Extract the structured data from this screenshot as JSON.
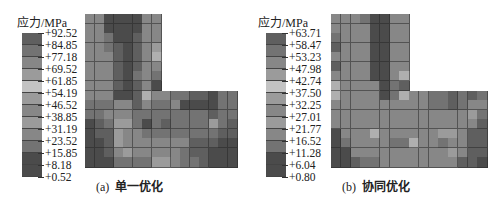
{
  "chart_data": [
    {
      "type": "heatmap",
      "title": "(a) 单一优化",
      "panel_label": "(a)",
      "panel_name": "单一优化",
      "legend_title": "应力/MPa",
      "colorbar_ticks": [
        "+92.52",
        "+84.85",
        "+77.18",
        "+69.52",
        "+61.85",
        "+54.19",
        "+46.52",
        "+38.85",
        "+31.19",
        "+23.52",
        "+15.85",
        "+8.18",
        "+0.52"
      ],
      "vmin": 0.52,
      "vmax": 92.52,
      "grid": {
        "rows": 16,
        "cols": 16,
        "shape": "L-shaped (upper-right 8x8 empty)"
      },
      "shade_levels_1dark_9light": [
        [
          5,
          5,
          2,
          2,
          2,
          2,
          5,
          5,
          0,
          0,
          0,
          0,
          0,
          0,
          0,
          0
        ],
        [
          5,
          5,
          2,
          2,
          2,
          2,
          5,
          5,
          0,
          0,
          0,
          0,
          0,
          0,
          0,
          0
        ],
        [
          5,
          5,
          4,
          2,
          2,
          3,
          5,
          5,
          0,
          0,
          0,
          0,
          0,
          0,
          0,
          0
        ],
        [
          5,
          5,
          4,
          3,
          2,
          3,
          5,
          6,
          0,
          0,
          0,
          0,
          0,
          0,
          0,
          0
        ],
        [
          5,
          5,
          5,
          3,
          2,
          3,
          5,
          7,
          0,
          0,
          0,
          0,
          0,
          0,
          0,
          0
        ],
        [
          5,
          5,
          5,
          3,
          2,
          3,
          5,
          5,
          0,
          0,
          0,
          0,
          0,
          0,
          0,
          0
        ],
        [
          5,
          5,
          5,
          3,
          2,
          4,
          5,
          4,
          0,
          0,
          0,
          0,
          0,
          0,
          0,
          0
        ],
        [
          5,
          5,
          5,
          3,
          2,
          3,
          5,
          2,
          0,
          0,
          0,
          0,
          0,
          0,
          0,
          0
        ],
        [
          5,
          5,
          5,
          2,
          2,
          3,
          7,
          5,
          5,
          4,
          4,
          3,
          3,
          2,
          4,
          4
        ],
        [
          4,
          4,
          4,
          5,
          5,
          3,
          5,
          4,
          4,
          5,
          2,
          2,
          2,
          2,
          4,
          4
        ],
        [
          4,
          4,
          5,
          5,
          5,
          4,
          4,
          4,
          4,
          4,
          4,
          4,
          4,
          3,
          4,
          4
        ],
        [
          2,
          3,
          4,
          6,
          6,
          4,
          2,
          4,
          3,
          4,
          4,
          4,
          4,
          6,
          4,
          3
        ],
        [
          2,
          3,
          3,
          6,
          5,
          5,
          4,
          4,
          4,
          4,
          4,
          4,
          4,
          4,
          3,
          3
        ],
        [
          2,
          2,
          3,
          6,
          5,
          5,
          5,
          5,
          5,
          5,
          5,
          3,
          3,
          3,
          2,
          2
        ],
        [
          2,
          2,
          3,
          5,
          6,
          5,
          5,
          5,
          5,
          5,
          4,
          3,
          3,
          2,
          2,
          2
        ],
        [
          2,
          2,
          2,
          4,
          4,
          4,
          4,
          6,
          6,
          5,
          4,
          4,
          3,
          2,
          2,
          2
        ]
      ]
    },
    {
      "type": "heatmap",
      "title": "(b) 协同优化",
      "panel_label": "(b)",
      "panel_name": "协同优化",
      "legend_title": "应力/MPa",
      "colorbar_ticks": [
        "+63.71",
        "+58.47",
        "+53.23",
        "+47.98",
        "+42.74",
        "+37.50",
        "+32.25",
        "+27.01",
        "+21.77",
        "+16.52",
        "+11.28",
        "+6.04",
        "+0.80"
      ],
      "vmin": 0.8,
      "vmax": 63.71,
      "grid": {
        "rows": 16,
        "cols": 16,
        "shape": "L-shaped (upper-right 8x8 empty)"
      },
      "shade_levels_1dark_9light": [
        [
          5,
          5,
          5,
          4,
          2,
          2,
          5,
          5,
          0,
          0,
          0,
          0,
          0,
          0,
          0,
          0
        ],
        [
          5,
          5,
          5,
          5,
          2,
          2,
          5,
          5,
          0,
          0,
          0,
          0,
          0,
          0,
          0,
          0
        ],
        [
          4,
          5,
          5,
          5,
          2,
          2,
          5,
          5,
          0,
          0,
          0,
          0,
          0,
          0,
          0,
          0
        ],
        [
          3,
          5,
          5,
          5,
          2,
          2,
          5,
          5,
          0,
          0,
          0,
          0,
          0,
          0,
          0,
          0
        ],
        [
          5,
          5,
          5,
          5,
          2,
          2,
          5,
          5,
          0,
          0,
          0,
          0,
          0,
          0,
          0,
          0
        ],
        [
          3,
          5,
          5,
          5,
          2,
          2,
          5,
          5,
          0,
          0,
          0,
          0,
          0,
          0,
          0,
          0
        ],
        [
          5,
          5,
          5,
          5,
          2,
          2,
          5,
          7,
          0,
          0,
          0,
          0,
          0,
          0,
          0,
          0
        ],
        [
          7,
          5,
          5,
          5,
          5,
          2,
          4,
          3,
          0,
          0,
          0,
          0,
          0,
          0,
          0,
          0
        ],
        [
          7,
          5,
          5,
          5,
          5,
          2,
          4,
          7,
          5,
          5,
          4,
          4,
          3,
          4,
          3,
          4
        ],
        [
          5,
          5,
          5,
          5,
          5,
          5,
          5,
          5,
          5,
          5,
          4,
          4,
          3,
          4,
          5,
          5
        ],
        [
          5,
          5,
          5,
          5,
          5,
          5,
          5,
          5,
          5,
          5,
          5,
          5,
          5,
          5,
          6,
          4
        ],
        [
          5,
          5,
          5,
          5,
          5,
          5,
          5,
          5,
          5,
          5,
          5,
          5,
          5,
          5,
          5,
          3
        ],
        [
          2,
          5,
          5,
          5,
          7,
          5,
          5,
          5,
          5,
          5,
          5,
          6,
          6,
          5,
          3,
          3
        ],
        [
          2,
          4,
          5,
          5,
          5,
          5,
          4,
          4,
          7,
          5,
          5,
          4,
          5,
          5,
          3,
          3
        ],
        [
          2,
          2,
          5,
          5,
          5,
          5,
          5,
          5,
          5,
          5,
          5,
          5,
          6,
          5,
          3,
          3
        ],
        [
          2,
          2,
          3,
          4,
          4,
          5,
          5,
          5,
          5,
          5,
          5,
          5,
          5,
          3,
          3,
          2
        ]
      ]
    }
  ],
  "panels": [
    {
      "legend_title": "应力/MPa",
      "caption_label": "(a)",
      "caption_text": "单一优化"
    },
    {
      "legend_title": "应力/MPa",
      "caption_label": "(b)",
      "caption_text": "协同优化"
    }
  ]
}
